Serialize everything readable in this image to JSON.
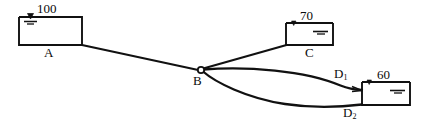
{
  "figure": {
    "type": "hydraulic-pipe-network-diagram",
    "line_color": "#111111",
    "background_color": "#ffffff"
  },
  "reservoirs": [
    {
      "id": "A",
      "label": "A",
      "head": "100",
      "water_surface_icon": "water-level-symbol",
      "x": 19,
      "y": 17,
      "w": 63,
      "h": 28,
      "level_marker_side": "left",
      "label_x": 47,
      "label_y": 50,
      "head_x": 41,
      "head_y": 4
    },
    {
      "id": "C",
      "label": "C",
      "head": "70",
      "water_surface_icon": "water-level-symbol",
      "x": 286,
      "y": 23,
      "w": 47,
      "h": 22,
      "level_marker_side": "right",
      "label_x": 306,
      "label_y": 49,
      "head_x": 303,
      "head_y": 11
    },
    {
      "id": "D",
      "label": "",
      "head": "60",
      "water_surface_icon": "water-level-symbol",
      "x": 362,
      "y": 82,
      "w": 48,
      "h": 23,
      "level_marker_side": "right",
      "label_x": 0,
      "label_y": 0,
      "head_x": 379,
      "head_y": 70
    }
  ],
  "junction": {
    "id": "B",
    "label": "B",
    "cx": 201,
    "cy": 70,
    "r": 3.2,
    "label_x": 195,
    "label_y": 80
  },
  "node_labels": [
    {
      "name": "label-d1",
      "base": "D",
      "sub": "1",
      "x": 336,
      "y": 72
    },
    {
      "name": "label-d2",
      "base": "D",
      "sub": "2",
      "x": 345,
      "y": 111
    }
  ],
  "pipes": [
    {
      "name": "pipe-a-b",
      "from": "A",
      "to": "B",
      "shape": "straight"
    },
    {
      "name": "pipe-b-c",
      "from": "B",
      "to": "C",
      "shape": "straight"
    },
    {
      "name": "pipe-b-d1",
      "from": "B",
      "to": "D1",
      "shape": "curve-upper"
    },
    {
      "name": "pipe-b-d2",
      "from": "B",
      "to": "D2",
      "shape": "curve-lower"
    }
  ]
}
